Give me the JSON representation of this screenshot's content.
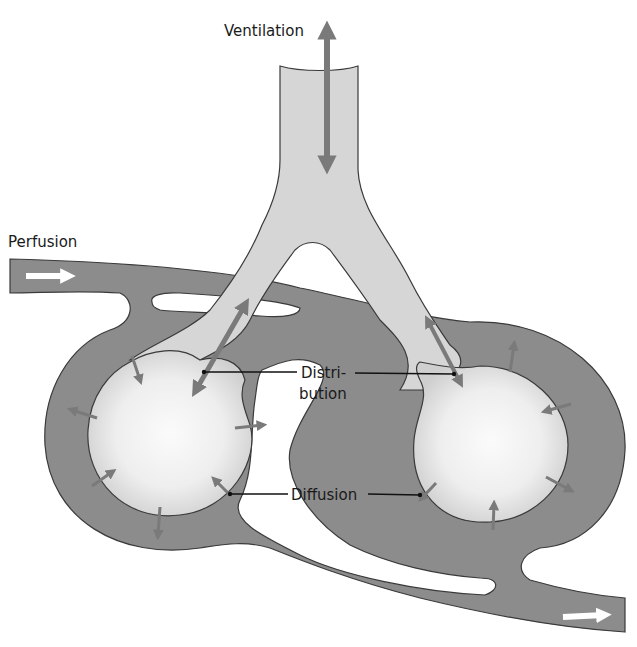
{
  "diagram": {
    "type": "physiology-schematic",
    "labels": {
      "ventilation": "Ventilation",
      "perfusion": "Perfusion",
      "distribution_line1": "Distri-",
      "distribution_line2": "bution",
      "diffusion": "Diffusion"
    },
    "elements": [
      {
        "id": "trachea",
        "kind": "airway",
        "description": "Light grey airway tube entering from top, bifurcating into two branches"
      },
      {
        "id": "left-alveolus",
        "kind": "alveolus",
        "description": "Left spherical air sac with radial gas-exchange arrows"
      },
      {
        "id": "right-alveolus",
        "kind": "alveolus",
        "description": "Right spherical air sac with radial gas-exchange arrows"
      },
      {
        "id": "capillary",
        "kind": "blood-vessel",
        "description": "Dark grey blood vessel looping around both alveoli, inflow at left, outflow at bottom right"
      }
    ],
    "arrows": {
      "ventilation": "bidirectional vertical arrow in trachea",
      "distribution": "bidirectional diagonal arrows in each bronchial branch",
      "perfusion_in": "white arrow pointing right at top-left",
      "perfusion_out": "white arrow pointing right at bottom-right",
      "diffusion": "small arrows crossing alveolar walls in both directions"
    },
    "colors": {
      "vessel": "#8c8c8c",
      "airway": "#d6d6d6",
      "arrow": "#7a7a7a",
      "alveolus_center": "#fafafa",
      "background": "#ffffff"
    }
  }
}
